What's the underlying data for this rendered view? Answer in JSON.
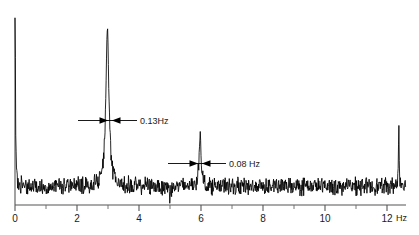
{
  "chart_data": {
    "type": "line",
    "title": "",
    "subtitle": "",
    "xlabel": "Hz",
    "ylabel": "",
    "xlim": [
      0,
      12.6
    ],
    "ylim": [
      0,
      1.05
    ],
    "grid": false,
    "legend": null,
    "x_ticks_major": [
      0,
      2,
      4,
      6,
      8,
      10,
      12
    ],
    "x_tick_labels": [
      "0",
      "2",
      "4",
      "6",
      "8",
      "10",
      "12"
    ],
    "x_ticks_minor": [
      1,
      3,
      5,
      7,
      9,
      11
    ],
    "axis_unit_label": "Hz",
    "line_color": "#000000",
    "axis_color": "#4d4d4d",
    "background_color": "#ffffff",
    "series": [
      {
        "name": "spectrum",
        "description": "Noise floor with DC spike at 0 Hz, strong narrow peak at 3 Hz, weaker peak at 6 Hz, and a spike at the right edge near 12.4 Hz",
        "noise_floor_level": 0.1,
        "noise_amplitude": 0.035,
        "peaks": [
          {
            "center": 0.0,
            "height": 1.0,
            "width": 0.035,
            "label": "DC spike"
          },
          {
            "center": 2.98,
            "height": 0.82,
            "width": 0.13,
            "label": "0.13Hz"
          },
          {
            "center": 5.97,
            "height": 0.3,
            "width": 0.08,
            "label": "0.08 Hz"
          },
          {
            "center": 12.38,
            "height": 0.32,
            "width": 0.03,
            "label": "edge spike"
          }
        ],
        "dips": [
          {
            "center": 5.0,
            "depth": 0.07,
            "width": 0.04
          }
        ]
      }
    ],
    "annotations": [
      {
        "id": "linewidth-3hz",
        "text": "0.13Hz",
        "value": 0.13,
        "unit": "Hz",
        "target_peak_hz": 2.98,
        "style": "double-arrow-with-leader"
      },
      {
        "id": "linewidth-6hz",
        "text": "0.08 Hz",
        "value": 0.08,
        "unit": "Hz",
        "target_peak_hz": 5.97,
        "style": "double-arrow-with-leader"
      }
    ]
  },
  "figure": {
    "caption": ""
  }
}
